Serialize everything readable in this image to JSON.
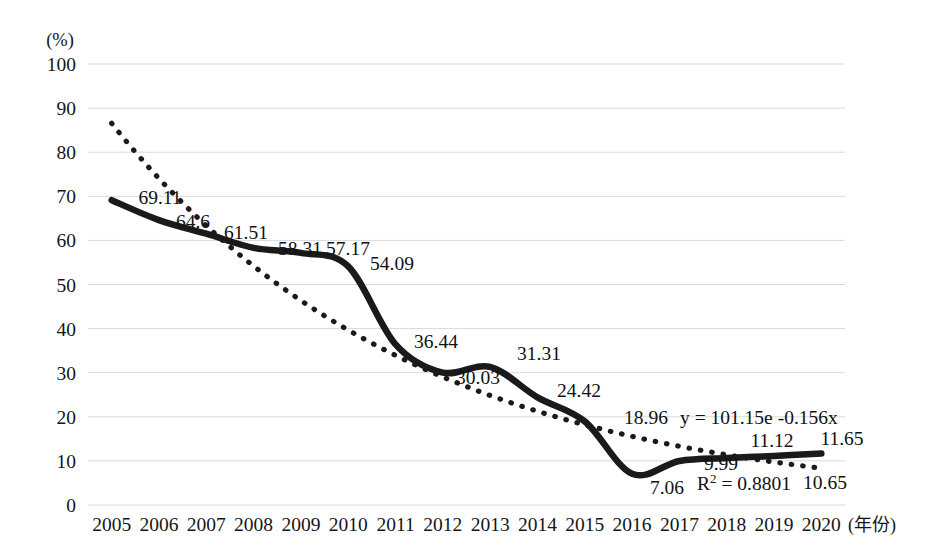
{
  "chart_data": {
    "type": "line",
    "title": "",
    "xlabel": "(年份)",
    "ylabel": "(%)",
    "unit_label": "(%)",
    "x_axis_name": "(年份)",
    "categories": [
      "2005",
      "2006",
      "2007",
      "2008",
      "2009",
      "2010",
      "2011",
      "2012",
      "2013",
      "2014",
      "2015",
      "2016",
      "2017",
      "2018",
      "2019",
      "2020"
    ],
    "values": [
      69.11,
      64.6,
      61.51,
      58.31,
      57.17,
      54.09,
      36.44,
      30.03,
      31.31,
      24.42,
      18.96,
      7.06,
      9.99,
      10.65,
      11.12,
      11.65
    ],
    "data_labels": [
      "69.11",
      "64.6",
      "61.51",
      "58.31",
      "57.17",
      "54.09",
      "36.44",
      "30.03",
      "31.31",
      "24.42",
      "18.96",
      "7.06",
      "9.99",
      "10.65",
      "11.12",
      "11.65"
    ],
    "ylim": [
      0,
      100
    ],
    "ytick_labels": [
      "100",
      "90",
      "80",
      "70",
      "60",
      "50",
      "40",
      "30",
      "20",
      "10",
      "0"
    ],
    "ytick_values": [
      100,
      90,
      80,
      70,
      60,
      50,
      40,
      30,
      20,
      10,
      0
    ],
    "grid": true,
    "legend": "none",
    "series": [
      {
        "name": "data",
        "style": "solid-thick-smooth",
        "values": [
          69.11,
          64.6,
          61.51,
          58.31,
          57.17,
          54.09,
          36.44,
          30.03,
          31.31,
          24.42,
          18.96,
          7.06,
          9.99,
          10.65,
          11.12,
          11.65
        ]
      },
      {
        "name": "trendline",
        "style": "dotted",
        "type": "exponential",
        "equation": "y = 101.15e",
        "equation_exponent": "-0.156x",
        "equation_full": "y = 101.15e -0.156x",
        "r_squared_label": "R",
        "r_squared_sup": "2",
        "r_squared_value": " = 0.8801",
        "r_squared_full": "R² = 0.8801",
        "a": 101.15,
        "b": -0.156
      }
    ],
    "colors": {
      "series_line": "#1a1a1a",
      "trend_line": "#1a1a1a",
      "grid": "#d9d9d9",
      "background": "#ffffff",
      "text": "#111111"
    },
    "label_positions": [
      {
        "label": "69.11",
        "x": 160,
        "y": 204
      },
      {
        "label": "64.6",
        "x": 193,
        "y": 228
      },
      {
        "label": "61.51",
        "x": 246,
        "y": 239
      },
      {
        "label": "58.31",
        "x": 300,
        "y": 255
      },
      {
        "label": "57.17",
        "x": 348,
        "y": 255
      },
      {
        "label": "54.09",
        "x": 392,
        "y": 270
      },
      {
        "label": "36.44",
        "x": 436,
        "y": 348
      },
      {
        "label": "30.03",
        "x": 478,
        "y": 384
      },
      {
        "label": "31.31",
        "x": 539,
        "y": 360
      },
      {
        "label": "24.42",
        "x": 579,
        "y": 397
      },
      {
        "label": "18.96",
        "x": 646,
        "y": 424
      },
      {
        "label": "7.06",
        "x": 667,
        "y": 494
      },
      {
        "label": "9.99",
        "x": 721,
        "y": 470
      },
      {
        "label": "10.65",
        "x": 825,
        "y": 489
      },
      {
        "label": "11.12",
        "x": 772,
        "y": 447
      },
      {
        "label": "11.65",
        "x": 842,
        "y": 445
      }
    ],
    "equation_position": {
      "x": 680,
      "y": 424
    },
    "r_squared_position": {
      "x": 697,
      "y": 490
    }
  }
}
